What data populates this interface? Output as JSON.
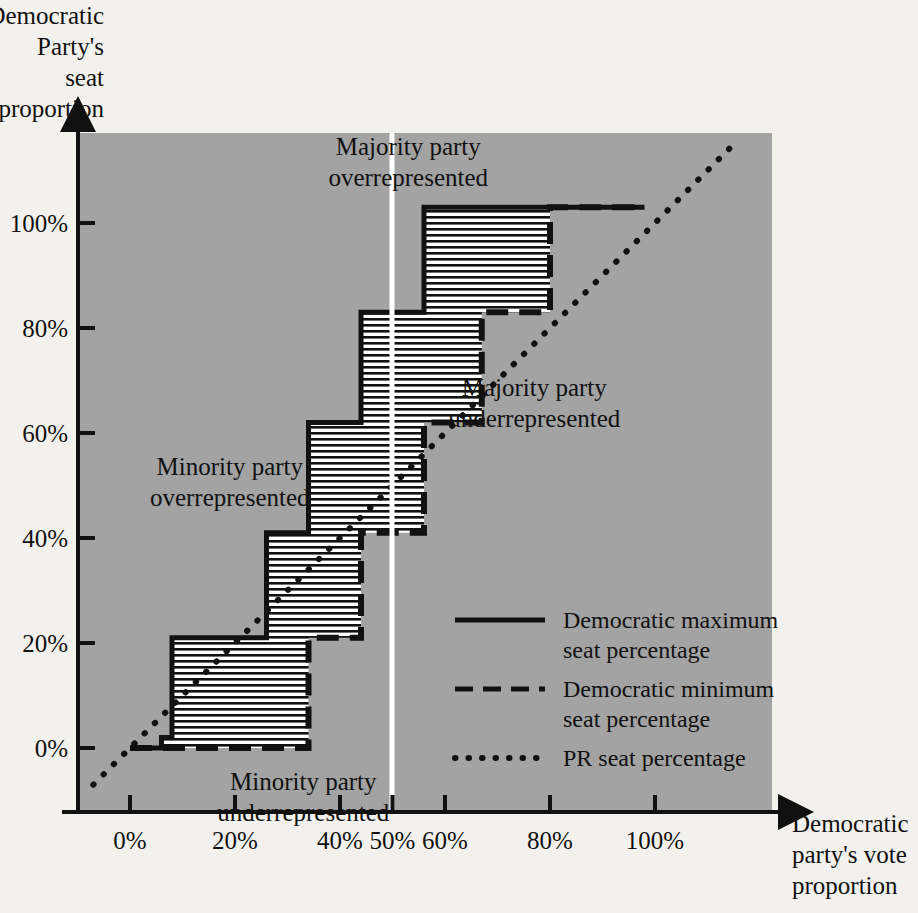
{
  "chart_data": {
    "type": "line",
    "title": "",
    "xlabel": "Democratic party's vote proportion",
    "ylabel": "Democratic Party's seat proportion",
    "xlim": [
      -10,
      122
    ],
    "ylim": [
      -12,
      120
    ],
    "grid": false,
    "legend_position": "inside-lower-right",
    "x_ticks": [
      "0%",
      "20%",
      "40%",
      "50%",
      "60%",
      "80%",
      "100%"
    ],
    "x_tick_values": [
      0,
      20,
      40,
      50,
      60,
      80,
      100
    ],
    "y_ticks": [
      "0%",
      "20%",
      "40%",
      "60%",
      "80%",
      "100%"
    ],
    "y_tick_values": [
      0,
      20,
      40,
      60,
      80,
      100
    ],
    "marker_line_50_percent": 50,
    "series": [
      {
        "name": "Democratic maximum seat percentage",
        "style": "solid",
        "points": [
          [
            0,
            0
          ],
          [
            6,
            0
          ],
          [
            6,
            2
          ],
          [
            8,
            2
          ],
          [
            8,
            21
          ],
          [
            26,
            21
          ],
          [
            26,
            41
          ],
          [
            34,
            41
          ],
          [
            34,
            62
          ],
          [
            44,
            62
          ],
          [
            44,
            83
          ],
          [
            56,
            83
          ],
          [
            56,
            103
          ],
          [
            95,
            103
          ],
          [
            98,
            103
          ]
        ]
      },
      {
        "name": "Democratic minimum seat percentage",
        "style": "dashed",
        "points": [
          [
            0,
            0
          ],
          [
            34,
            0
          ],
          [
            34,
            21
          ],
          [
            44,
            21
          ],
          [
            44,
            41
          ],
          [
            56,
            41
          ],
          [
            56,
            62
          ],
          [
            67,
            62
          ],
          [
            67,
            83
          ],
          [
            80,
            83
          ],
          [
            80,
            103
          ],
          [
            98,
            103
          ]
        ]
      },
      {
        "name": "PR seat percentage",
        "style": "dotted",
        "points": [
          [
            -7,
            -7
          ],
          [
            115,
            115
          ]
        ]
      }
    ],
    "band_fill": "horizontal-hatch",
    "annotations": [
      {
        "id": "majority-overrepresented",
        "text_lines": [
          "Majority party",
          "overrepresented"
        ],
        "x": 53,
        "y": 113
      },
      {
        "id": "majority-underrepresented",
        "text_lines": [
          "Majority party",
          "underrepresented"
        ],
        "x": 77,
        "y": 67
      },
      {
        "id": "minority-overrepresented",
        "text_lines": [
          "Minority party",
          "overrepresented"
        ],
        "x": 19,
        "y": 52
      },
      {
        "id": "minority-underrepresented",
        "text_lines": [
          "Minority party",
          "underrepresented"
        ],
        "x": 33,
        "y": -8
      }
    ]
  },
  "axes": {
    "y_label_lines": [
      "Democratic",
      "Party's",
      "seat",
      "proportion"
    ],
    "x_label_lines": [
      "Democratic",
      "party's vote",
      "proportion"
    ]
  },
  "legend": {
    "items": [
      {
        "id": "dem-max",
        "style": "solid",
        "lines": [
          "Democratic maximum",
          "seat percentage"
        ]
      },
      {
        "id": "dem-min",
        "style": "dashed",
        "lines": [
          "Democratic minimum",
          "seat percentage"
        ]
      },
      {
        "id": "pr",
        "style": "dotted",
        "lines": [
          "PR seat percentage"
        ]
      }
    ]
  },
  "colors": {
    "plot_background": "#a3a3a3",
    "page_background": "#f3f1ee",
    "ink": "#111111",
    "band_fill": "#ffffff",
    "marker_line": "#ffffff"
  }
}
